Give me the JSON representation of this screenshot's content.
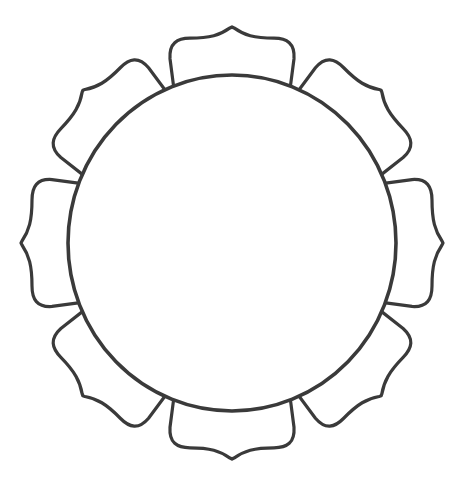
{
  "figure": {
    "center": {
      "x": 232,
      "y": 243
    },
    "circle": {
      "rx": 164,
      "ry": 168
    },
    "petal_count": 8,
    "petal_tip_radius": 211,
    "stroke_color": "#3a3a3a",
    "fill_color": "#ffffff"
  }
}
